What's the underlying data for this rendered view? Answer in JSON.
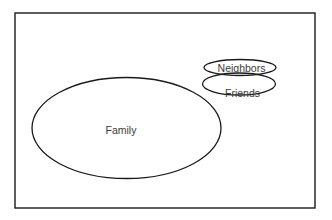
{
  "diagram": {
    "type": "euler",
    "universe": {
      "x": 15,
      "y": 13,
      "width": 300,
      "height": 195
    },
    "sets": [
      {
        "id": "family",
        "label": "Family",
        "cx": 126.5,
        "cy": 128,
        "rx": 94.5,
        "ry": 50.5,
        "label_x": 121,
        "label_y": 134,
        "font_size": 10.5
      },
      {
        "id": "friends",
        "label": "Friends",
        "cx": 239,
        "cy": 84,
        "rx": 36.5,
        "ry": 11,
        "label_x": 242.5,
        "label_y": 96.5,
        "font_size": 10.5
      },
      {
        "id": "neighbors",
        "label": "Neighbors",
        "cx": 240,
        "cy": 67.5,
        "rx": 36,
        "ry": 8,
        "label_x": 241.5,
        "label_y": 71.5,
        "font_size": 10.5
      }
    ],
    "colors": {
      "stroke": "#1a1a1a",
      "text": "#3a3a3a",
      "background": "#ffffff"
    }
  }
}
